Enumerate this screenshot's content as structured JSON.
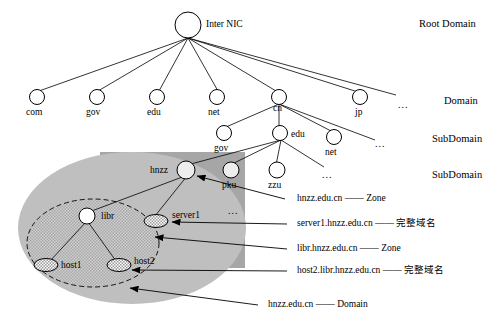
{
  "diagram": {
    "colors": {
      "line": "#000000",
      "text": "#000000",
      "node_fill": "#ffffff",
      "node_fill_shaded": "#e8e8e8",
      "zone_rect": "#a6a6a6",
      "zone_ellipse": "#bfbfbf",
      "subzone_ellipse": "#c9c9c9",
      "background": "#ffffff"
    },
    "tiers": [
      {
        "id": "tier-root",
        "label": "Root Domain"
      },
      {
        "id": "tier-domain",
        "label": "Domain"
      },
      {
        "id": "tier-subdomain1",
        "label": "SubDomain"
      },
      {
        "id": "tier-subdomain2",
        "label": "SubDomain"
      }
    ],
    "nodes": [
      {
        "id": "root",
        "label": "Inter NIC",
        "shape": "circle",
        "fill": "white"
      },
      {
        "id": "com",
        "label": "com",
        "shape": "circle",
        "fill": "white"
      },
      {
        "id": "gov",
        "label": "gov",
        "shape": "circle",
        "fill": "white"
      },
      {
        "id": "edu",
        "label": "edu",
        "shape": "circle",
        "fill": "white"
      },
      {
        "id": "net",
        "label": "net",
        "shape": "circle",
        "fill": "white"
      },
      {
        "id": "cn",
        "label": "cn",
        "shape": "circle",
        "fill": "white"
      },
      {
        "id": "jp",
        "label": "jp",
        "shape": "circle",
        "fill": "white"
      },
      {
        "id": "cn-gov",
        "label": "gov",
        "shape": "circle",
        "fill": "white"
      },
      {
        "id": "cn-edu",
        "label": "edu",
        "shape": "circle",
        "fill": "white"
      },
      {
        "id": "cn-net",
        "label": "net",
        "shape": "circle",
        "fill": "white"
      },
      {
        "id": "hnzz",
        "label": "hnzz",
        "shape": "circle",
        "fill": "shaded"
      },
      {
        "id": "pku",
        "label": "pku",
        "shape": "circle",
        "fill": "shaded"
      },
      {
        "id": "zzu",
        "label": "zzu",
        "shape": "circle",
        "fill": "white"
      },
      {
        "id": "libr",
        "label": "libr",
        "shape": "circle",
        "fill": "white"
      },
      {
        "id": "server1",
        "label": "server1",
        "shape": "ellipse",
        "fill": "hatched"
      },
      {
        "id": "host1",
        "label": "host1",
        "shape": "ellipse",
        "fill": "hatched"
      },
      {
        "id": "host2",
        "label": "host2",
        "shape": "ellipse",
        "fill": "hatched"
      }
    ],
    "ellipsis_marks": [
      {
        "id": "ellipsis-domain",
        "label": "..."
      },
      {
        "id": "ellipsis-subdomain",
        "label": "..."
      },
      {
        "id": "ellipsis-hnzz",
        "label": "..."
      },
      {
        "id": "ellipsis-zone",
        "label": "..."
      }
    ],
    "annotations": [
      {
        "id": "ann-zone-hnzz",
        "name": "hnzz.edu.cn",
        "sep": "——",
        "kind": "Zone"
      },
      {
        "id": "ann-fqdn-server",
        "name": "server1.hnzz.edu.cn",
        "sep": "——",
        "kind": "完整域名"
      },
      {
        "id": "ann-zone-libr",
        "name": "libr.hnzz.edu.cn",
        "sep": "——",
        "kind": "Zone"
      },
      {
        "id": "ann-fqdn-host2",
        "name": "host2.libr.hnzz.edu.cn",
        "sep": "——",
        "kind": "完整域名"
      },
      {
        "id": "ann-domain-hnzz",
        "name": "hnzz.edu.cn",
        "sep": "——",
        "kind": "Domain"
      }
    ]
  }
}
